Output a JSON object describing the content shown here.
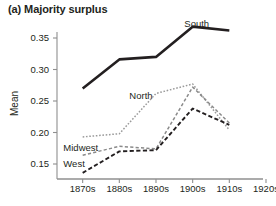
{
  "chart_data": {
    "type": "line",
    "title": "(a) Majority surplus",
    "xlabel": "",
    "ylabel": "Mean",
    "x": [
      "1870s",
      "1880s",
      "1890s",
      "1900s",
      "1910s",
      "1920s"
    ],
    "x_values": [
      1875,
      1885,
      1895,
      1905,
      1915
    ],
    "xticklabels": [
      "1870s",
      "1880s",
      "1890s",
      "1900s",
      "1910s",
      "1920s"
    ],
    "yticklabels": [
      "0.15",
      "0.20",
      "0.25",
      "0.30",
      "0.35"
    ],
    "ylim": [
      0.128,
      0.378
    ],
    "xlim": [
      1868,
      1922
    ],
    "grid": false,
    "legend": "inline-labels",
    "series": [
      {
        "name": "South",
        "style": "solid-thick",
        "color": "#231f20",
        "x": [
          1875,
          1885,
          1895,
          1905,
          1915
        ],
        "values": [
          0.27,
          0.316,
          0.32,
          0.368,
          0.362
        ],
        "label_x": 1903,
        "label_y": 0.372
      },
      {
        "name": "North",
        "style": "dotted",
        "color": "#9a9a9a",
        "x": [
          1875,
          1885,
          1895,
          1905,
          1915
        ],
        "values": [
          0.193,
          0.198,
          0.262,
          0.277,
          0.204
        ],
        "label_x": 1888,
        "label_y": 0.258
      },
      {
        "name": "Midwest",
        "style": "dashed-fine",
        "color": "#8a8a8a",
        "x": [
          1875,
          1885,
          1895,
          1905,
          1915
        ],
        "values": [
          0.164,
          0.178,
          0.174,
          0.272,
          0.215
        ],
        "label_x": 1870,
        "label_y": 0.176
      },
      {
        "name": "West",
        "style": "dashed-bold",
        "color": "#231f20",
        "x": [
          1875,
          1885,
          1895,
          1905,
          1915
        ],
        "values": [
          0.136,
          0.17,
          0.172,
          0.238,
          0.212
        ],
        "label_x": 1870,
        "label_y": 0.15
      }
    ]
  },
  "axis": {
    "y_title": "Mean"
  }
}
